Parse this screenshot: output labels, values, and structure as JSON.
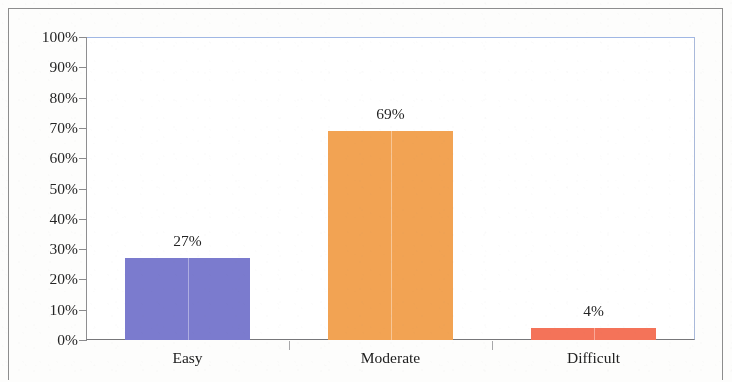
{
  "figure": {
    "kind": "bar-chart",
    "frame_color": "#8d8d8d",
    "plot_border_top_color": "#9fb6e2",
    "plot_border_right_color": "#a8b8d8",
    "axis_color": "#8a8a8c",
    "background": "#ffffff"
  },
  "chart_data": {
    "type": "bar",
    "title": "",
    "subtitle": "",
    "xlabel": "",
    "ylabel": "",
    "categories": [
      "Easy",
      "Moderate",
      "Difficult"
    ],
    "values": [
      27,
      69,
      4
    ],
    "value_labels": [
      "27%",
      "69%",
      "4%"
    ],
    "series": [
      {
        "name": "",
        "values": [
          27,
          69,
          4
        ]
      }
    ],
    "bar_colors": [
      "#7b7bcc",
      "#f0a254",
      "#f2735a"
    ],
    "ylim": [
      0,
      100
    ],
    "ytick_values": [
      0,
      10,
      20,
      30,
      40,
      50,
      60,
      70,
      80,
      90,
      100
    ],
    "ytick_labels": [
      "0%",
      "10%",
      "20%",
      "30%",
      "40%",
      "50%",
      "60%",
      "70%",
      "80%",
      "90%",
      "100%"
    ],
    "unit": "%",
    "grid": false,
    "legend": false,
    "legend_position": "none",
    "data_labels_shown": true,
    "annotations": []
  }
}
